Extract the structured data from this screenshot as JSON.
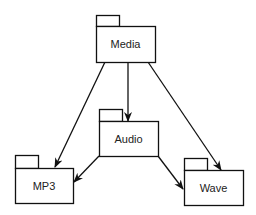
{
  "diagram": {
    "type": "uml-package-dependency",
    "packages": [
      {
        "id": "media",
        "label": "Media",
        "tab": {
          "x": 96,
          "y": 15,
          "w": 23,
          "h": 11
        },
        "body": {
          "x": 96,
          "y": 26,
          "w": 59,
          "h": 36
        }
      },
      {
        "id": "audio",
        "label": "Audio",
        "tab": {
          "x": 99,
          "y": 109,
          "w": 23,
          "h": 12
        },
        "body": {
          "x": 99,
          "y": 121,
          "w": 59,
          "h": 35
        }
      },
      {
        "id": "mp3",
        "label": "MP3",
        "tab": {
          "x": 15,
          "y": 155,
          "w": 23,
          "h": 13
        },
        "body": {
          "x": 15,
          "y": 168,
          "w": 58,
          "h": 35
        }
      },
      {
        "id": "wave",
        "label": "Wave",
        "tab": {
          "x": 184,
          "y": 158,
          "w": 23,
          "h": 12
        },
        "body": {
          "x": 184,
          "y": 170,
          "w": 59,
          "h": 35
        }
      }
    ],
    "edges": [
      {
        "from": "media",
        "to": "mp3",
        "x1": 105,
        "y1": 62,
        "x2": 55,
        "y2": 167
      },
      {
        "from": "media",
        "to": "audio",
        "x1": 128,
        "y1": 62,
        "x2": 128,
        "y2": 121
      },
      {
        "from": "media",
        "to": "wave",
        "x1": 148,
        "y1": 62,
        "x2": 221,
        "y2": 170
      },
      {
        "from": "audio",
        "to": "mp3",
        "x1": 99,
        "y1": 156,
        "x2": 74,
        "y2": 182
      },
      {
        "from": "audio",
        "to": "wave",
        "x1": 158,
        "y1": 156,
        "x2": 183,
        "y2": 189
      }
    ],
    "colors": {
      "stroke": "#111111",
      "fill": "#ffffff",
      "text": "#222222"
    }
  }
}
